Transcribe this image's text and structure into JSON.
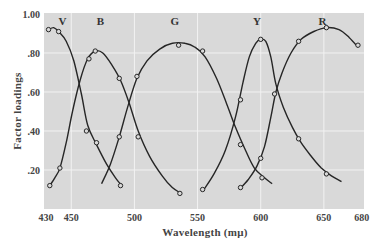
{
  "chart_data": {
    "type": "line",
    "title": "",
    "xlabel": "Wavelength (mμ)",
    "ylabel": "Factor loadings",
    "xlim": [
      430,
      682
    ],
    "ylim": [
      0,
      1.0
    ],
    "x_ticks": [
      430,
      450,
      500,
      550,
      600,
      650,
      680
    ],
    "x_tick_labels": [
      "430",
      "450",
      "500",
      "550",
      "600",
      "650",
      "680"
    ],
    "y_ticks": [
      0.2,
      0.4,
      0.6,
      0.8,
      1.0
    ],
    "y_tick_labels": [
      ".20",
      ".40",
      ".60",
      ".80",
      "1.00"
    ],
    "grid": true,
    "legend": "none",
    "band_labels": [
      {
        "label": "V",
        "x": 443
      },
      {
        "label": "B",
        "x": 473
      },
      {
        "label": "G",
        "x": 532
      },
      {
        "label": "Y",
        "x": 597
      },
      {
        "label": "R",
        "x": 649
      }
    ],
    "series": [
      {
        "name": "V",
        "curve": [
          [
            432,
            0.92
          ],
          [
            436,
            0.93
          ],
          [
            440,
            0.91
          ],
          [
            446,
            0.86
          ],
          [
            452,
            0.76
          ],
          [
            458,
            0.59
          ],
          [
            463,
            0.43
          ],
          [
            470,
            0.33
          ],
          [
            478,
            0.23
          ],
          [
            485,
            0.16
          ],
          [
            490,
            0.12
          ]
        ],
        "points": [
          [
            432,
            0.92
          ],
          [
            440,
            0.91
          ],
          [
            462,
            0.4
          ],
          [
            470,
            0.34
          ],
          [
            489,
            0.12
          ]
        ]
      },
      {
        "name": "B",
        "curve": [
          [
            433,
            0.12
          ],
          [
            437,
            0.16
          ],
          [
            441,
            0.21
          ],
          [
            446,
            0.34
          ],
          [
            451,
            0.5
          ],
          [
            457,
            0.66
          ],
          [
            463,
            0.77
          ],
          [
            469,
            0.81
          ],
          [
            475,
            0.8
          ],
          [
            482,
            0.74
          ],
          [
            489,
            0.66
          ],
          [
            496,
            0.54
          ],
          [
            503,
            0.4
          ],
          [
            512,
            0.27
          ],
          [
            522,
            0.17
          ],
          [
            530,
            0.11
          ],
          [
            537,
            0.08
          ]
        ],
        "points": [
          [
            433,
            0.12
          ],
          [
            441,
            0.21
          ],
          [
            464,
            0.77
          ],
          [
            469,
            0.81
          ],
          [
            488,
            0.67
          ],
          [
            503,
            0.37
          ],
          [
            536,
            0.08
          ]
        ]
      },
      {
        "name": "G",
        "curve": [
          [
            474,
            0.13
          ],
          [
            481,
            0.23
          ],
          [
            488,
            0.37
          ],
          [
            495,
            0.53
          ],
          [
            502,
            0.67
          ],
          [
            510,
            0.76
          ],
          [
            520,
            0.82
          ],
          [
            530,
            0.85
          ],
          [
            540,
            0.85
          ],
          [
            548,
            0.83
          ],
          [
            556,
            0.78
          ],
          [
            565,
            0.67
          ],
          [
            573,
            0.54
          ],
          [
            580,
            0.42
          ],
          [
            588,
            0.3
          ],
          [
            595,
            0.21
          ],
          [
            603,
            0.16
          ],
          [
            609,
            0.13
          ]
        ],
        "points": [
          [
            488,
            0.37
          ],
          [
            502,
            0.68
          ],
          [
            535,
            0.84
          ],
          [
            554,
            0.81
          ],
          [
            584,
            0.33
          ],
          [
            601,
            0.16
          ]
        ]
      },
      {
        "name": "Y",
        "curve": [
          [
            555,
            0.1
          ],
          [
            563,
            0.18
          ],
          [
            572,
            0.3
          ],
          [
            580,
            0.47
          ],
          [
            586,
            0.65
          ],
          [
            591,
            0.78
          ],
          [
            596,
            0.85
          ],
          [
            600,
            0.87
          ],
          [
            604,
            0.86
          ],
          [
            608,
            0.78
          ],
          [
            612,
            0.64
          ],
          [
            618,
            0.52
          ],
          [
            625,
            0.42
          ],
          [
            632,
            0.34
          ],
          [
            640,
            0.27
          ],
          [
            648,
            0.21
          ],
          [
            656,
            0.17
          ],
          [
            664,
            0.14
          ]
        ],
        "points": [
          [
            554,
            0.1
          ],
          [
            584,
            0.56
          ],
          [
            600,
            0.87
          ],
          [
            630,
            0.36
          ],
          [
            652,
            0.18
          ]
        ]
      },
      {
        "name": "R",
        "curve": [
          [
            583,
            0.1
          ],
          [
            590,
            0.15
          ],
          [
            597,
            0.22
          ],
          [
            603,
            0.32
          ],
          [
            608,
            0.47
          ],
          [
            612,
            0.6
          ],
          [
            617,
            0.7
          ],
          [
            624,
            0.8
          ],
          [
            632,
            0.87
          ],
          [
            642,
            0.91
          ],
          [
            652,
            0.93
          ],
          [
            662,
            0.92
          ],
          [
            670,
            0.88
          ],
          [
            677,
            0.83
          ]
        ],
        "points": [
          [
            584,
            0.11
          ],
          [
            600,
            0.26
          ],
          [
            611,
            0.59
          ],
          [
            630,
            0.86
          ],
          [
            652,
            0.93
          ],
          [
            677,
            0.84
          ]
        ]
      }
    ]
  }
}
